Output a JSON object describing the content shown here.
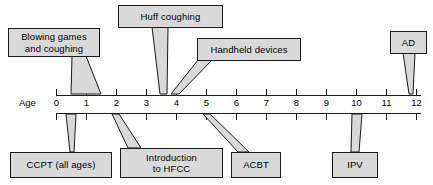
{
  "figure": {
    "type": "timeline-diagram",
    "axis": {
      "name": "Age",
      "label": "Age",
      "unit": "years",
      "ticks": [
        "0",
        "1",
        "2",
        "3",
        "4",
        "5",
        "6",
        "7",
        "8",
        "9",
        "10",
        "11",
        "12"
      ],
      "min": 0,
      "max": 12
    },
    "colors": {
      "box_fill": "#d9d9d9",
      "box_border": "#1a1a1a",
      "axis_line": "#1a1a1a",
      "text": "#000000",
      "background": "#ffffff"
    },
    "callouts_above": [
      {
        "id": "blowing-games",
        "label": "Blowing games\nand coughing",
        "age_start": 0.5,
        "age_end": 1.5
      },
      {
        "id": "huff-coughing",
        "label": "Huff coughing",
        "age_start": 3.7,
        "age_end": 3.7
      },
      {
        "id": "handheld-devices",
        "label": "Handheld devices",
        "age_start": 4.0,
        "age_end": 4.4
      },
      {
        "id": "ad",
        "label": "AD",
        "age_start": 12,
        "age_end": 12
      }
    ],
    "callouts_below": [
      {
        "id": "ccpt",
        "label": "CCPT (all ages)",
        "age_start": 0.4,
        "age_end": 0.6
      },
      {
        "id": "introduction-hfcc",
        "label": "Introduction\nto HFCC",
        "age_start": 2.0,
        "age_end": 2.1
      },
      {
        "id": "acbt",
        "label": "ACBT",
        "age_start": 5.0,
        "age_end": 5.1
      },
      {
        "id": "ipv",
        "label": "IPV",
        "age_start": 10.0,
        "age_end": 10.0
      }
    ]
  }
}
